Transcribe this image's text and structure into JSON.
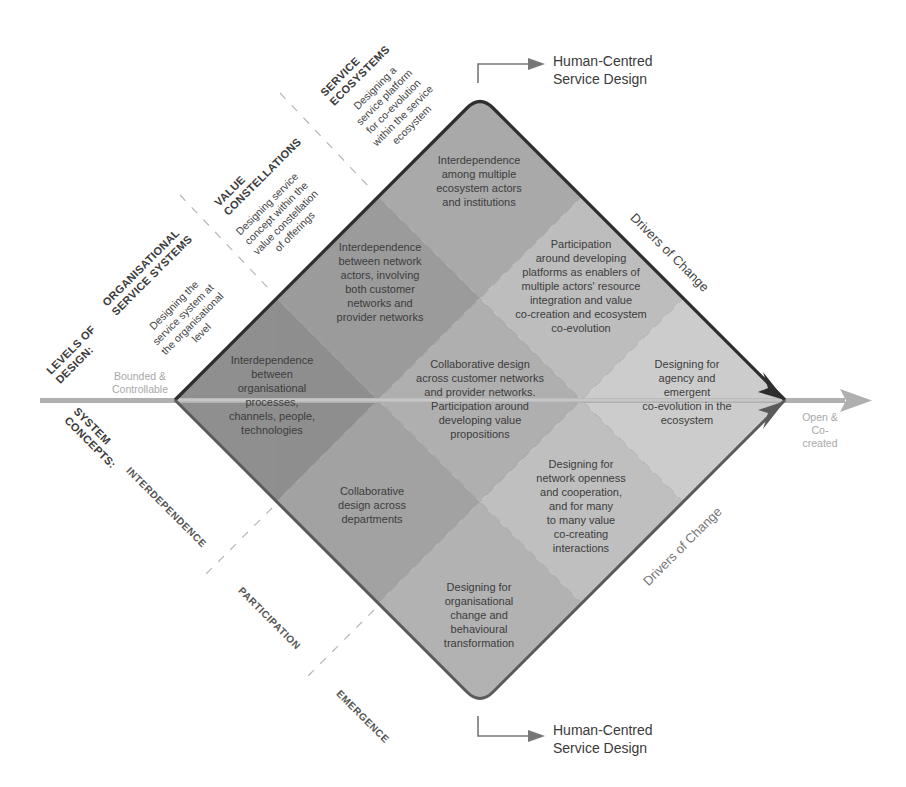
{
  "diagram": {
    "axis": {
      "left_label": "Bounded &\nControllable",
      "right_label": "Open &\nCo-created"
    },
    "levels_of_design": {
      "title": "LEVELS OF\nDESIGN:",
      "levels": [
        {
          "heading": "ORGANISATIONAL\nSERVICE SYSTEMS",
          "description": "Designing the\nservice system at\nthe organisational\nlevel"
        },
        {
          "heading": "VALUE\nCONSTELLATIONS",
          "description": "Designing service\nconcept within the\nvalue constellation\nof offerings"
        },
        {
          "heading": "SERVICE\nECOSYSTEMS",
          "description": "Designing a\nservice platform\nfor co-evolution\nwithin the service\necosystem"
        }
      ]
    },
    "system_concepts": {
      "title": "SYSTEM\nCONCEPTS:",
      "concepts": [
        "INTERDEPENDENCE",
        "PARTICIPATION",
        "EMERGENCE"
      ]
    },
    "human_centred": {
      "top": "Human-Centred\nService Design",
      "bottom": "Human-Centred\nService Design"
    },
    "drivers": {
      "upper": "Drivers of Change",
      "lower": "Drivers of Change"
    },
    "cells": [
      {
        "id": "org-interdependence",
        "text": "Interdependence\nbetween\norganisational\nprocesses,\nchannels, people,\ntechnologies"
      },
      {
        "id": "vc-interdependence",
        "text": "Interdependence\nbetween network\nactors, involving\nboth customer\nnetworks and\nprovider networks"
      },
      {
        "id": "eco-interdependence",
        "text": "Interdependence\namong multiple\necosystem actors\nand institutions"
      },
      {
        "id": "org-participation",
        "text": "Collaborative\ndesign across\ndepartments"
      },
      {
        "id": "vc-participation",
        "text": "Collaborative design\nacross customer networks\nand provider networks.\nParticipation around\ndeveloping value\npropositions"
      },
      {
        "id": "eco-participation",
        "text": "Participation\naround developing\nplatforms as enablers of\nmultiple actors' resource\nintegration and value\nco-creation and ecosystem\nco-evolution"
      },
      {
        "id": "org-emergence",
        "text": "Designing for\norganisational\nchange and\nbehavioural\ntransformation"
      },
      {
        "id": "vc-emergence",
        "text": "Designing for\nnetwork openness\nand cooperation,\nand for many\nto many value\nco-creating\ninteractions"
      },
      {
        "id": "eco-emergence",
        "text": "Designing for\nagency and\nemergent\nco-evolution in the\necosystem"
      }
    ],
    "colors": {
      "dark": "#8f8f8f",
      "mid": "#a6a6a6",
      "light": "#bdbdbd",
      "lightest": "#cfcfcf",
      "outline": "#2e2e2e",
      "axis": "#b0b0b0"
    }
  }
}
